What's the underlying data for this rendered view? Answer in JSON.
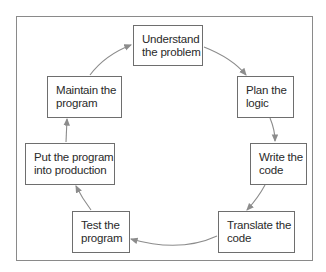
{
  "diagram": {
    "type": "cycle",
    "nodes": [
      {
        "id": "understand",
        "label": "Understand\nthe problem"
      },
      {
        "id": "plan",
        "label": "Plan the\nlogic"
      },
      {
        "id": "write",
        "label": "Write the\ncode"
      },
      {
        "id": "translate",
        "label": "Translate the\ncode"
      },
      {
        "id": "test",
        "label": "Test the\nprogram"
      },
      {
        "id": "production",
        "label": "Put the program\ninto production"
      },
      {
        "id": "maintain",
        "label": "Maintain the\nprogram"
      }
    ],
    "edges": [
      [
        "understand",
        "plan"
      ],
      [
        "plan",
        "write"
      ],
      [
        "write",
        "translate"
      ],
      [
        "translate",
        "test"
      ],
      [
        "test",
        "production"
      ],
      [
        "production",
        "maintain"
      ],
      [
        "maintain",
        "understand"
      ]
    ],
    "colors": {
      "box_border": "#6e6e6e",
      "arrow": "#8c8c8c",
      "frame": "#8a8a8a"
    }
  }
}
